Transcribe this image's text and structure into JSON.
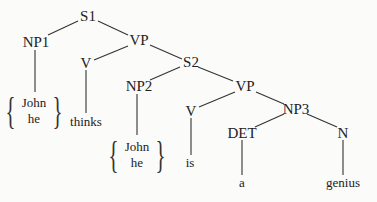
{
  "diagram": {
    "type": "syntax-tree",
    "nodes": {
      "s1": "S1",
      "np1": "NP1",
      "vp1": "VP",
      "v1": "V",
      "s2": "S2",
      "np2": "NP2",
      "vp2": "VP",
      "v2": "V",
      "np3": "NP3",
      "det": "DET",
      "n": "N"
    },
    "leaves": {
      "np1_options": [
        "John",
        "he"
      ],
      "v1": "thinks",
      "np2_options": [
        "John",
        "he"
      ],
      "v2": "is",
      "det": "a",
      "n": "genius"
    },
    "edges": [
      [
        "S1",
        "NP1"
      ],
      [
        "S1",
        "VP"
      ],
      [
        "VP",
        "V"
      ],
      [
        "VP",
        "S2"
      ],
      [
        "S2",
        "NP2"
      ],
      [
        "S2",
        "VP"
      ],
      [
        "VP",
        "V"
      ],
      [
        "VP",
        "NP3"
      ],
      [
        "NP3",
        "DET"
      ],
      [
        "NP3",
        "N"
      ]
    ],
    "colors": {
      "ink": "#222222",
      "background": "#fbfbfa"
    }
  }
}
